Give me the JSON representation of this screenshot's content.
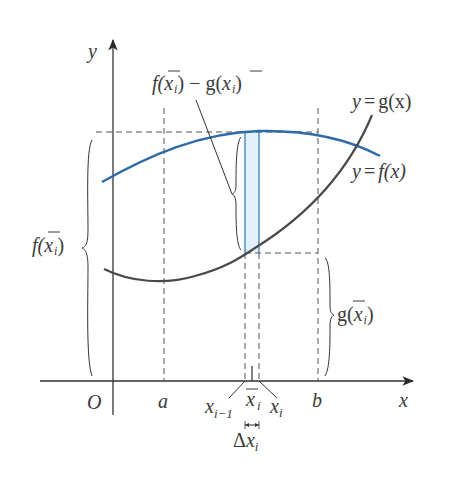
{
  "figure": {
    "axes": {
      "x_label": "x",
      "y_label": "y",
      "origin_label": "O"
    },
    "ticks": {
      "a": "a",
      "b": "b",
      "x_im1_main": "x",
      "x_im1_sub": "i−1",
      "xbar_main": "x",
      "xbar_sub": "i",
      "xi_main": "x",
      "xi_sub": "i"
    },
    "curves": {
      "f": {
        "label_lhs": "y",
        "label_eq": "=",
        "label_rhs": "f(x)",
        "color": "#2e6aa8"
      },
      "g": {
        "label_lhs": "y",
        "label_eq": "=",
        "label_rhs": "g(x)",
        "color": "#4a4a4a"
      }
    },
    "annotations": {
      "difference": {
        "f": "f(",
        "x": "x",
        "sub": "i",
        "mid": ") − g(",
        "x2": "x",
        "sub2": "i",
        "end": ")"
      },
      "f_height": {
        "f": "f(",
        "x": "x",
        "sub": "i",
        "end": ")"
      },
      "g_height": {
        "g": "g(",
        "x": "x",
        "sub": "i",
        "end": ")"
      },
      "delta": {
        "delta": "Δ",
        "x": "x",
        "sub": "i"
      }
    },
    "colors": {
      "strip_fill": "#e3f1fb",
      "strip_stroke": "#3d7fc0",
      "axis": "#333333",
      "dashed": "#555555"
    }
  }
}
